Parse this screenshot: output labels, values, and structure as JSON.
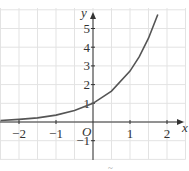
{
  "chart_data": {
    "type": "line",
    "title": "",
    "function": "y = e^x",
    "xlabel": "x",
    "ylabel": "y",
    "origin_label": "O",
    "xlim": [
      -2.5,
      2.5
    ],
    "ylim": [
      -2,
      6
    ],
    "grid": true,
    "grid_step_x": 0.5,
    "grid_step_y": 1,
    "x_ticks": [
      {
        "value": -2,
        "label": "−2"
      },
      {
        "value": -1,
        "label": "−1"
      },
      {
        "value": 1,
        "label": "1"
      },
      {
        "value": 2,
        "label": "2"
      }
    ],
    "y_ticks": [
      {
        "value": -1,
        "label": "−1"
      },
      {
        "value": 1,
        "label": "1"
      },
      {
        "value": 2,
        "label": "2"
      },
      {
        "value": 3,
        "label": "3"
      },
      {
        "value": 4,
        "label": "4"
      },
      {
        "value": 5,
        "label": "5"
      }
    ],
    "series": [
      {
        "name": "curve",
        "x": [
          -2.5,
          -2,
          -1.5,
          -1,
          -0.5,
          0,
          0.5,
          1,
          1.25,
          1.5,
          1.75
        ],
        "y": [
          0.08,
          0.14,
          0.22,
          0.37,
          0.61,
          1.0,
          1.65,
          2.72,
          3.49,
          4.48,
          5.75
        ]
      }
    ],
    "caption": "~"
  },
  "colors": {
    "curve": "#555555",
    "grid": "#e3e3e3",
    "axis": "#333333"
  }
}
